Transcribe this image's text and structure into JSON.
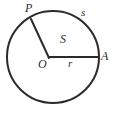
{
  "figure": {
    "background_color": "#ffffff",
    "stroke_color": "#2b2b2b",
    "label_color": "#2b2b2b",
    "circle": {
      "center_x": 53,
      "center_y": 57,
      "radius": 46,
      "stroke_width": 2
    },
    "radius_to_A": {
      "from_x": 49,
      "from_y": 57,
      "to_x": 99,
      "to_y": 57,
      "stroke_width": 2
    },
    "radius_to_P": {
      "from_x": 49,
      "from_y": 58,
      "to_x": 31,
      "to_y": 19,
      "stroke_width": 2
    },
    "labels": {
      "point_P": "P",
      "arc_length": "s",
      "sector_area": "S",
      "point_A": "A",
      "center_O": "O",
      "radius": "r"
    }
  }
}
